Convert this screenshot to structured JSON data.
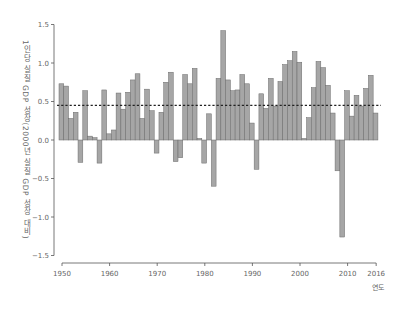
{
  "chart_data": {
    "type": "bar",
    "title": "",
    "xlabel": "연도",
    "ylabel": "1인당 실질 GDP 성장(2000년 실질 GDP 성장 대비)",
    "ylim": [
      -1.5,
      1.5
    ],
    "xlim": [
      1950,
      2016
    ],
    "grid": false,
    "legend": null,
    "y_ticks": [
      "1.5",
      "1.0",
      "0.5",
      "0.0",
      "-0.5",
      "-1.0",
      "-1.5"
    ],
    "y_tick_values": [
      1.5,
      1.0,
      0.5,
      0.0,
      -0.5,
      -1.0,
      -1.5
    ],
    "x_ticks": [
      "1950",
      "1960",
      "1970",
      "1980",
      "1990",
      "2000",
      "2010",
      "2016"
    ],
    "x_tick_values": [
      1950,
      1960,
      1970,
      1980,
      1990,
      2000,
      2010,
      2016
    ],
    "reference_line": {
      "style": "dashed",
      "value": 0.45,
      "label": "average"
    },
    "categories": [
      1950,
      1951,
      1952,
      1953,
      1954,
      1955,
      1956,
      1957,
      1958,
      1959,
      1960,
      1961,
      1962,
      1963,
      1964,
      1965,
      1966,
      1967,
      1968,
      1969,
      1970,
      1971,
      1972,
      1973,
      1974,
      1975,
      1976,
      1977,
      1978,
      1979,
      1980,
      1981,
      1982,
      1983,
      1984,
      1985,
      1986,
      1987,
      1988,
      1989,
      1990,
      1991,
      1992,
      1993,
      1994,
      1995,
      1996,
      1997,
      1998,
      1999,
      2000,
      2001,
      2002,
      2003,
      2004,
      2005,
      2006,
      2007,
      2008,
      2009,
      2010,
      2011,
      2012,
      2013,
      2014,
      2015,
      2016
    ],
    "values": [
      0.73,
      0.7,
      0.28,
      0.36,
      -0.29,
      0.64,
      0.05,
      0.03,
      -0.3,
      0.65,
      0.08,
      0.13,
      0.61,
      0.4,
      0.62,
      0.78,
      0.86,
      0.28,
      0.66,
      0.38,
      -0.17,
      0.36,
      0.75,
      0.88,
      -0.28,
      -0.23,
      0.85,
      0.73,
      0.93,
      0.02,
      -0.3,
      0.34,
      -0.6,
      0.8,
      1.42,
      0.78,
      0.64,
      0.65,
      0.85,
      0.73,
      0.22,
      -0.38,
      0.6,
      0.41,
      0.8,
      0.44,
      0.76,
      0.98,
      1.03,
      1.15,
      1.01,
      0.02,
      0.29,
      0.68,
      1.02,
      0.94,
      0.71,
      0.35,
      -0.4,
      -1.26,
      0.64,
      0.31,
      0.58,
      0.44,
      0.67,
      0.84,
      0.35
    ]
  }
}
